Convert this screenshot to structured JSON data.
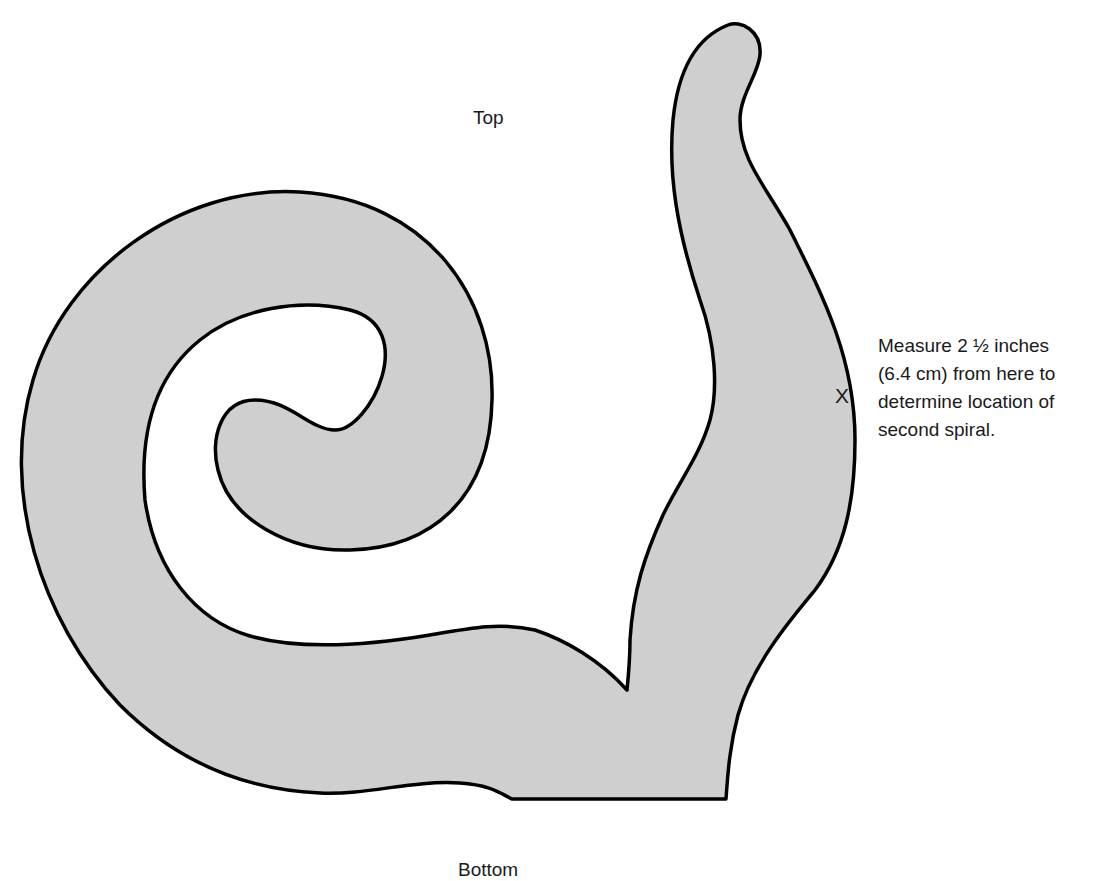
{
  "diagram": {
    "type": "craft-template",
    "shape": "spiral-with-upright-stem",
    "fill_color": "#cfcfcf",
    "outline_color": "#000000",
    "background_color": "#ffffff"
  },
  "labels": {
    "top": "Top",
    "bottom": "Bottom",
    "marker": "X"
  },
  "instruction": {
    "lines": [
      "Measure 2 ½ inches",
      "(6.4 cm) from here to",
      "determine location of",
      "second spiral."
    ]
  }
}
